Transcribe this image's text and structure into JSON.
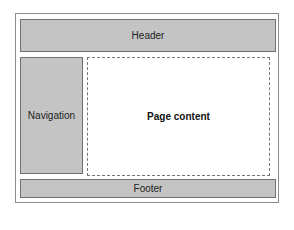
{
  "diagram": {
    "header": {
      "label": "Header"
    },
    "navigation": {
      "label": "Navigation"
    },
    "content": {
      "label": "Page content"
    },
    "footer": {
      "label": "Footer"
    }
  }
}
